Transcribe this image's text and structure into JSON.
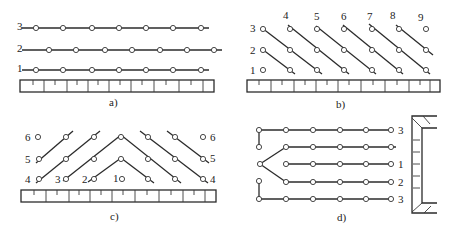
{
  "figure": {
    "panels": [
      {
        "id": "a",
        "caption": "a)",
        "row_labels": [
          "3",
          "2",
          "1"
        ],
        "description": "Three parallel horizontal rows of holes above a bench base"
      },
      {
        "id": "b",
        "caption": "b)",
        "row_labels": [
          "3",
          "2",
          "1"
        ],
        "column_labels": [
          "4",
          "5",
          "6",
          "7",
          "8",
          "9"
        ],
        "description": "Diagonal connection lines across a staggered hole grid"
      },
      {
        "id": "c",
        "caption": "c)",
        "left_labels": [
          "6",
          "5",
          "4",
          "3",
          "2",
          "1"
        ],
        "right_labels": [
          "6",
          "5",
          "4"
        ],
        "description": "V-shaped (chevron) delay pattern symmetric about center hole 1"
      },
      {
        "id": "d",
        "caption": "d)",
        "row_labels": [
          "3",
          "",
          "1",
          "2",
          "3"
        ],
        "description": "Horizontal rows fanning from a left initiation point toward a wall"
      }
    ]
  }
}
